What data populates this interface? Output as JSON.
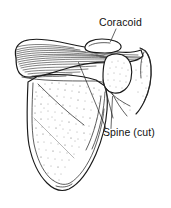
{
  "figure": {
    "view": "anterior view with spine cut",
    "background_color": "#ffffff",
    "ink_color": "#1a1a1a",
    "width": 171,
    "height": 208
  },
  "labels": [
    {
      "id": "coracoid",
      "text": "Coracoid",
      "x": 99,
      "y": 26,
      "anchor": "start",
      "leader": "M 116 29 L 110.5 41.5",
      "target_part": "coracoid-process"
    },
    {
      "id": "spine-cut",
      "text": "Spine (cut)",
      "x": 103,
      "y": 136,
      "anchor": "start",
      "leader": "M 106 128.5 L 78.5 62.5",
      "leader2": "M 111 128.5 L 112.5 96.5",
      "target_part": "spine-cut-surface"
    }
  ],
  "parts": [
    {
      "id": "scapula-body",
      "name": "scapula body"
    },
    {
      "id": "spine-cut-surface",
      "name": "spine of scapula (cut surface)"
    },
    {
      "id": "coracoid-process",
      "name": "coracoid process"
    },
    {
      "id": "glenoid-region",
      "name": "glenoid / acromion region"
    },
    {
      "id": "inferior-angle",
      "name": "inferior angle"
    },
    {
      "id": "lateral-border",
      "name": "lateral border"
    }
  ],
  "colors": {
    "ink": "#1a1a1a",
    "hatch": "#1a1a1a",
    "stipple": "#3a3a3a",
    "text": "#111111",
    "paper": "#ffffff"
  }
}
